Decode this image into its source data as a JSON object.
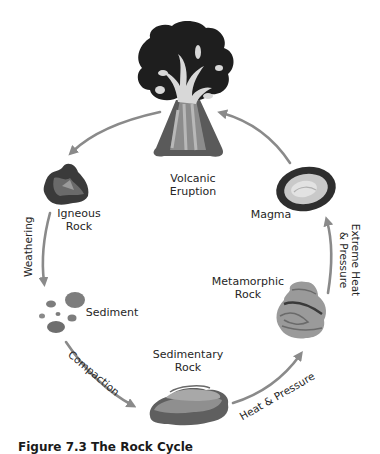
{
  "figure": {
    "caption": "Figure 7.3 The Rock Cycle",
    "colors": {
      "arrow": "#8a8a8a",
      "text": "#262626",
      "dark_rock": "#3a3a3a",
      "mid_rock": "#7d7d7d",
      "light_rock": "#b5b5b5",
      "ash_cloud": "#1e1e1e",
      "lava": "#d8d8d8"
    }
  },
  "stages": [
    {
      "id": "volcanic-eruption",
      "label_line1": "Volcanic",
      "label_line2": "Eruption",
      "icon": "volcano-icon"
    },
    {
      "id": "igneous-rock",
      "label_line1": "Igneous",
      "label_line2": "Rock",
      "icon": "igneous-rock-icon"
    },
    {
      "id": "sediment",
      "label_line1": "Sediment",
      "label_line2": "",
      "icon": "sediment-icon"
    },
    {
      "id": "sedimentary-rock",
      "label_line1": "Sedimentary",
      "label_line2": "Rock",
      "icon": "sedimentary-rock-icon"
    },
    {
      "id": "metamorphic-rock",
      "label_line1": "Metamorphic",
      "label_line2": "Rock",
      "icon": "metamorphic-rock-icon"
    },
    {
      "id": "magma",
      "label_line1": "Magma",
      "label_line2": "",
      "icon": "magma-icon"
    }
  ],
  "processes": [
    {
      "from": "volcanic-eruption",
      "to": "igneous-rock",
      "label": ""
    },
    {
      "from": "igneous-rock",
      "to": "sediment",
      "label": "Weathering"
    },
    {
      "from": "sediment",
      "to": "sedimentary-rock",
      "label": "Compaction"
    },
    {
      "from": "sedimentary-rock",
      "to": "metamorphic-rock",
      "label": "Heat & Pressure"
    },
    {
      "from": "metamorphic-rock",
      "to": "magma",
      "label_line1": "Extreme Heat",
      "label_line2": "& Pressure"
    },
    {
      "from": "magma",
      "to": "volcanic-eruption",
      "label": ""
    }
  ]
}
